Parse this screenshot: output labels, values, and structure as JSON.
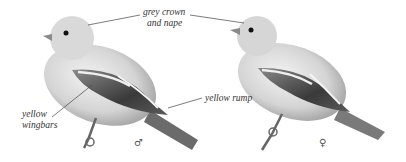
{
  "figure": {
    "birds": [
      {
        "id": "male",
        "sex_symbol": "♂"
      },
      {
        "id": "female",
        "sex_symbol": "♀"
      }
    ],
    "annotations": {
      "crown_line1": "grey crown",
      "crown_line2": "and nape",
      "wingbars_line1": "yellow",
      "wingbars_line2": "wingbars",
      "rump": "yellow rump"
    },
    "colors": {
      "body_light": "#e6e6e6",
      "body_mid": "#bdbdbd",
      "wing_dark": "#4a4a4a",
      "leader_line": "#444444"
    }
  }
}
